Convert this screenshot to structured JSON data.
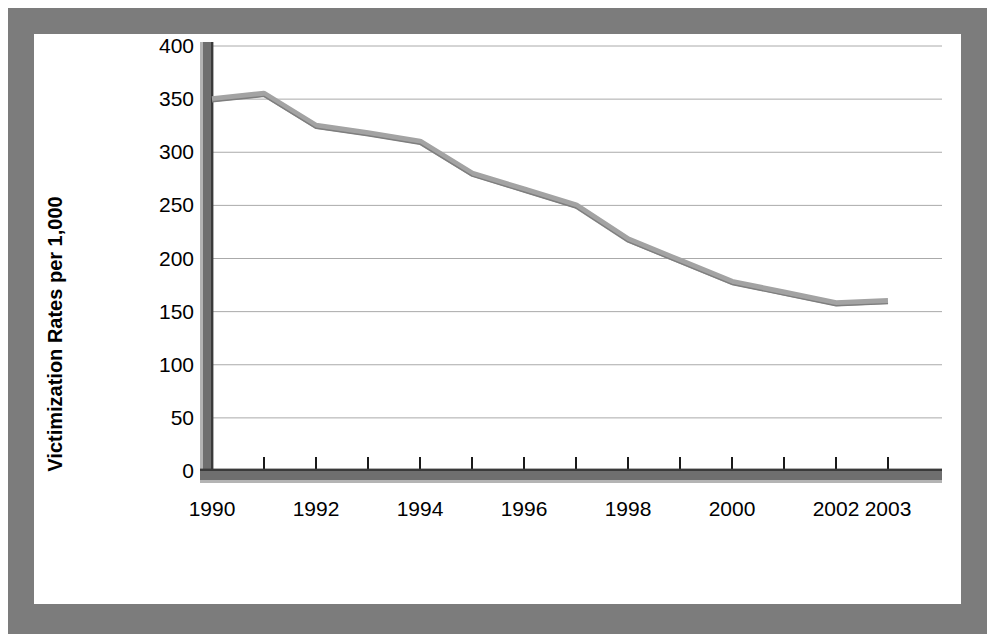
{
  "figure": {
    "frame_color": "#7c7c7c",
    "panel_background": "#ffffff",
    "line_color": "#a3a3a3",
    "gridline_color": "#aaaaaa",
    "axis_color": "#6f6f6f"
  },
  "axis": {
    "y_title": "Victimization Rates per 1,000",
    "y_ticks": [
      "0",
      "50",
      "100",
      "150",
      "200",
      "250",
      "300",
      "350",
      "400"
    ],
    "x_ticks": [
      "1990",
      "1992",
      "1994",
      "1996",
      "1998",
      "2000",
      "2002",
      "2003"
    ]
  },
  "chart_data": {
    "type": "line",
    "title": "",
    "xlabel": "",
    "ylabel": "Victimization Rates per 1,000",
    "xlim": [
      1990,
      2003
    ],
    "ylim": [
      0,
      400
    ],
    "grid": true,
    "legend": "none",
    "x": [
      1990,
      1991,
      1992,
      1993,
      1994,
      1995,
      1996,
      1997,
      1998,
      1999,
      2000,
      2001,
      2002,
      2003
    ],
    "x_tick_labels": [
      "1990",
      "1992",
      "1994",
      "1996",
      "1998",
      "2000",
      "2002",
      "2003"
    ],
    "x_tick_values": [
      1990,
      1992,
      1994,
      1996,
      1998,
      2000,
      2002,
      2003
    ],
    "y_tick_values": [
      0,
      50,
      100,
      150,
      200,
      250,
      300,
      350,
      400
    ],
    "series": [
      {
        "name": "Victimization Rate",
        "values": [
          350,
          355,
          325,
          318,
          310,
          280,
          265,
          250,
          218,
          198,
          178,
          168,
          158,
          160
        ]
      }
    ]
  }
}
